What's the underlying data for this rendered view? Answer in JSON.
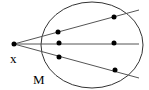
{
  "diagram": {
    "point_label": "x",
    "region_label": "M",
    "rays": 3,
    "points_per_ray": 2,
    "stroke_color": "#000000",
    "ray_color": "#555555"
  }
}
